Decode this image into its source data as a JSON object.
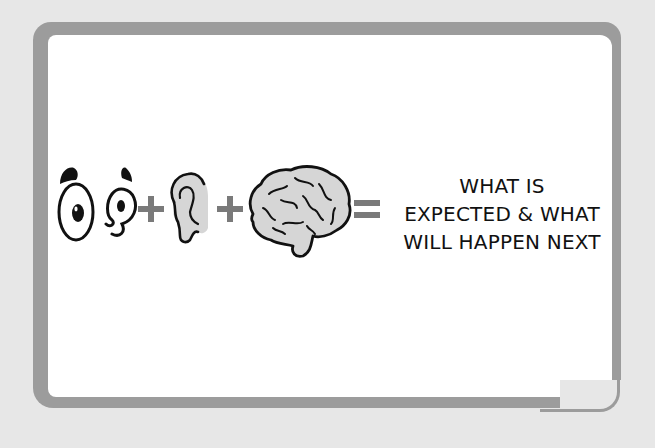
{
  "illustration": {
    "equation": {
      "terms": [
        {
          "name": "eyes",
          "icon": "eyes-icon"
        },
        {
          "operator": "+"
        },
        {
          "name": "ear",
          "icon": "ear-icon"
        },
        {
          "operator": "+"
        },
        {
          "name": "brain",
          "icon": "brain-icon"
        },
        {
          "operator": "="
        }
      ],
      "result_lines": [
        "WHAT IS",
        "EXPECTED & WHAT",
        "WILL HAPPEN NEXT"
      ]
    },
    "colors": {
      "background": "#e7e7e7",
      "frame": "#9c9c9c",
      "card": "#ffffff",
      "operator": "#7a7a7a",
      "fill_gray": "#d6d6d6",
      "ink": "#111111"
    }
  }
}
